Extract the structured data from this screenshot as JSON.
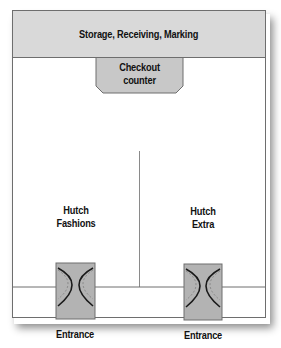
{
  "diagram": {
    "type": "store-floor-plan",
    "zones": {
      "storage": {
        "label": "Storage, Receiving, Marking"
      },
      "checkout": {
        "label_line1": "Checkout",
        "label_line2": "counter"
      },
      "left_store": {
        "label_line1": "Hutch",
        "label_line2": "Fashions"
      },
      "right_store": {
        "label_line1": "Hutch",
        "label_line2": "Extra"
      }
    },
    "entrances": [
      {
        "label": "Entrance",
        "icon": "double-door-icon"
      },
      {
        "label": "Entrance",
        "icon": "double-door-icon"
      }
    ],
    "colors": {
      "zone_fill": "#d9d9d9",
      "door_fill": "#b3b3b3",
      "outline": "#6e6e6e"
    }
  }
}
